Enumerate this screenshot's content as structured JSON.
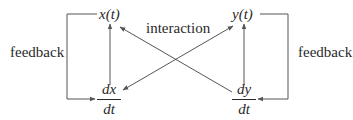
{
  "nodes": {
    "x": "x(t)",
    "y": "y(t)",
    "dx": {
      "num": "dx",
      "den": "dt"
    },
    "dy": {
      "num": "dy",
      "den": "dt"
    }
  },
  "labels": {
    "interaction": "interaction",
    "feedback_left": "feedback",
    "feedback_right": "feedback"
  },
  "colors": {
    "stroke": "#555555",
    "text": "#2a2a2a"
  }
}
